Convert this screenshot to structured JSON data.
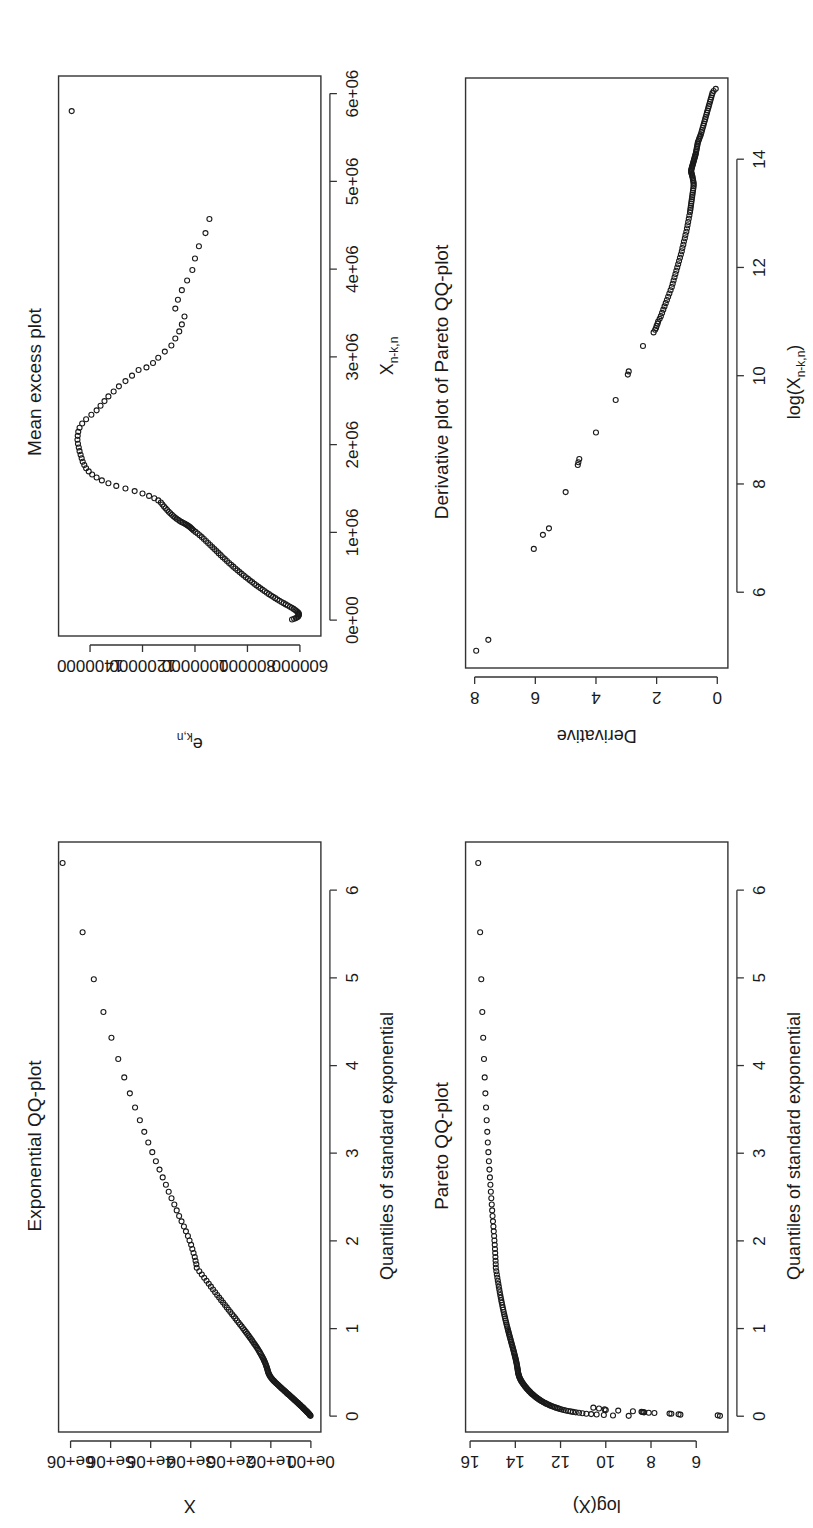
{
  "figure": {
    "layout": "2x2 grid of R base-graphics scatter plots, page rotated 90 degrees counter-clockwise",
    "background": "#ffffff",
    "point_color": "#1a1a1a",
    "frame_color": "#333333",
    "marker": "open-circle"
  },
  "chart_data": [
    {
      "id": "exponential-qq",
      "panel": "top-left (of the upright figure)",
      "type": "scatter",
      "title": "Exponential QQ-plot",
      "xlabel": "Quantiles of standard exponential",
      "ylabel": "X",
      "xlim": [
        -0.18,
        6.55
      ],
      "ylim": [
        -250000,
        6300000
      ],
      "xticks": [
        0,
        1,
        2,
        3,
        4,
        5,
        6
      ],
      "xticklabels": [
        "0",
        "1",
        "2",
        "3",
        "4",
        "5",
        "6"
      ],
      "yticks": [
        0,
        1000000,
        2000000,
        3000000,
        4000000,
        5000000,
        6000000
      ],
      "yticklabels": [
        "0e+00",
        "1e+06",
        "2e+06",
        "3e+06",
        "4e+06",
        "5e+06",
        "6e+06"
      ],
      "grid": false,
      "legend": "none",
      "x": [
        0.004,
        0.009,
        0.014,
        0.019,
        0.024,
        0.029,
        0.034,
        0.039,
        0.044,
        0.049,
        0.055,
        0.06,
        0.066,
        0.071,
        0.077,
        0.083,
        0.089,
        0.095,
        0.101,
        0.107,
        0.113,
        0.12,
        0.126,
        0.133,
        0.139,
        0.146,
        0.153,
        0.16,
        0.167,
        0.174,
        0.181,
        0.189,
        0.196,
        0.204,
        0.212,
        0.219,
        0.227,
        0.235,
        0.244,
        0.252,
        0.26,
        0.269,
        0.278,
        0.286,
        0.295,
        0.304,
        0.314,
        0.323,
        0.332,
        0.342,
        0.352,
        0.362,
        0.372,
        0.382,
        0.392,
        0.403,
        0.414,
        0.424,
        0.435,
        0.447,
        0.458,
        0.469,
        0.481,
        0.493,
        0.505,
        0.517,
        0.53,
        0.543,
        0.555,
        0.569,
        0.582,
        0.595,
        0.609,
        0.623,
        0.637,
        0.652,
        0.666,
        0.681,
        0.696,
        0.712,
        0.728,
        0.744,
        0.76,
        0.777,
        0.794,
        0.811,
        0.828,
        0.846,
        0.865,
        0.883,
        0.902,
        0.922,
        0.942,
        0.962,
        0.982,
        1.003,
        1.025,
        1.047,
        1.069,
        1.092,
        1.116,
        1.14,
        1.164,
        1.189,
        1.215,
        1.241,
        1.268,
        1.296,
        1.324,
        1.353,
        1.383,
        1.414,
        1.445,
        1.478,
        1.511,
        1.545,
        1.58,
        1.617,
        1.654,
        1.693,
        1.733,
        1.774,
        1.817,
        1.861,
        1.907,
        1.955,
        2.004,
        2.055,
        2.109,
        2.164,
        2.223,
        2.284,
        2.348,
        2.415,
        2.486,
        2.561,
        2.64,
        2.724,
        2.813,
        2.909,
        3.012,
        3.123,
        3.244,
        3.376,
        3.521,
        3.683,
        3.865,
        4.074,
        4.317,
        4.61,
        4.984,
        5.521,
        6.31
      ],
      "y": [
        8000,
        16000,
        24000,
        33000,
        42000,
        52000,
        62000,
        72000,
        83000,
        94000,
        105000,
        117000,
        129000,
        141000,
        154000,
        167000,
        180000,
        194000,
        208000,
        222000,
        236000,
        251000,
        266000,
        281000,
        297000,
        313000,
        329000,
        346000,
        363000,
        380000,
        398000,
        416000,
        434000,
        452000,
        471000,
        490000,
        509000,
        528000,
        548000,
        568000,
        589000,
        610000,
        631000,
        652000,
        674000,
        696000,
        718000,
        741000,
        764000,
        787000,
        810000,
        833000,
        857000,
        880000,
        903000,
        925000,
        947000,
        968000,
        988000,
        1006000,
        1022000,
        1036000,
        1048000,
        1059000,
        1068000,
        1076000,
        1084000,
        1092000,
        1101000,
        1110000,
        1120000,
        1131000,
        1143000,
        1156000,
        1170000,
        1185000,
        1201000,
        1218000,
        1236000,
        1255000,
        1275000,
        1296000,
        1318000,
        1341000,
        1365000,
        1390000,
        1416000,
        1443000,
        1471000,
        1500000,
        1530000,
        1561000,
        1593000,
        1626000,
        1660000,
        1695000,
        1731000,
        1768000,
        1806000,
        1845000,
        1885000,
        1926000,
        1968000,
        2011000,
        2055000,
        2100000,
        2146000,
        2193000,
        2241000,
        2290000,
        2340000,
        2391000,
        2443000,
        2496000,
        2550000,
        2606000,
        2664000,
        2724000,
        2786000,
        2850000,
        2860000,
        2880000,
        2900000,
        2930000,
        2960000,
        2990000,
        3030000,
        3070000,
        3120000,
        3170000,
        3230000,
        3290000,
        3350000,
        3410000,
        3480000,
        3550000,
        3620000,
        3700000,
        3780000,
        3870000,
        3960000,
        4060000,
        4160000,
        4270000,
        4390000,
        4520000,
        4660000,
        4810000,
        4980000,
        5180000,
        5420000,
        5700000,
        6200000
      ]
    },
    {
      "id": "mean-excess",
      "panel": "top-right (of the upright figure)",
      "type": "scatter",
      "title": "Mean excess plot",
      "xlabel": "X_{n-k,n}",
      "xlabel_base": "X",
      "xlabel_sub": "n-k,n",
      "ylabel": "e_{k,n}",
      "ylabel_base": "e",
      "ylabel_sub": "k,n",
      "xlim": [
        -180000,
        6200000
      ],
      "ylim": [
        520000,
        1520000
      ],
      "xticks": [
        0,
        1000000,
        2000000,
        3000000,
        4000000,
        5000000,
        6000000
      ],
      "xticklabels": [
        "0e+00",
        "1e+06",
        "2e+06",
        "3e+06",
        "4e+06",
        "5e+06",
        "6e+06"
      ],
      "yticks": [
        600000,
        800000,
        1000000,
        1200000,
        1400000
      ],
      "yticklabels": [
        "600000",
        "800000",
        "1000000",
        "1200000",
        "1400000"
      ],
      "grid": false,
      "legend": "none",
      "x": [
        8000,
        16000,
        24000,
        33000,
        42000,
        52000,
        62000,
        72000,
        83000,
        94000,
        105000,
        117000,
        129000,
        141000,
        154000,
        167000,
        180000,
        194000,
        208000,
        222000,
        236000,
        251000,
        266000,
        281000,
        297000,
        313000,
        329000,
        346000,
        363000,
        380000,
        398000,
        416000,
        434000,
        452000,
        471000,
        490000,
        509000,
        528000,
        548000,
        568000,
        589000,
        610000,
        631000,
        652000,
        674000,
        696000,
        718000,
        741000,
        764000,
        787000,
        810000,
        833000,
        857000,
        880000,
        903000,
        925000,
        947000,
        968000,
        988000,
        1006000,
        1022000,
        1036000,
        1048000,
        1059000,
        1068000,
        1076000,
        1084000,
        1092000,
        1101000,
        1110000,
        1120000,
        1131000,
        1143000,
        1156000,
        1170000,
        1185000,
        1201000,
        1218000,
        1236000,
        1255000,
        1275000,
        1296000,
        1318000,
        1341000,
        1365000,
        1390000,
        1416000,
        1443000,
        1471000,
        1500000,
        1530000,
        1561000,
        1593000,
        1626000,
        1660000,
        1695000,
        1731000,
        1768000,
        1806000,
        1845000,
        1885000,
        1926000,
        1968000,
        2011000,
        2055000,
        2100000,
        2146000,
        2193000,
        2241000,
        2290000,
        2340000,
        2391000,
        2443000,
        2496000,
        2550000,
        2606000,
        2664000,
        2724000,
        2786000,
        2850000,
        2880000,
        2930000,
        2990000,
        3060000,
        3130000,
        3210000,
        3290000,
        3370000,
        3460000,
        3550000,
        3650000,
        3760000,
        3870000,
        3990000,
        4120000,
        4260000,
        4410000,
        4570000,
        5800000
      ],
      "y": [
        630000,
        622000,
        615000,
        610000,
        607000,
        605000,
        604000,
        604000,
        606000,
        609000,
        613000,
        618000,
        624000,
        631000,
        638000,
        646000,
        654000,
        662000,
        670000,
        678000,
        686000,
        694000,
        702000,
        710000,
        718000,
        726000,
        734000,
        742000,
        750000,
        758000,
        766000,
        774000,
        782000,
        790000,
        798000,
        806000,
        814000,
        822000,
        830000,
        838000,
        846000,
        854000,
        862000,
        870000,
        878000,
        886000,
        894000,
        902000,
        910000,
        918000,
        926000,
        934000,
        942000,
        950000,
        958000,
        966000,
        974000,
        982000,
        990000,
        998000,
        1005000,
        1010000,
        1014000,
        1018000,
        1022000,
        1026000,
        1030000,
        1035000,
        1040000,
        1046000,
        1052000,
        1058000,
        1064000,
        1070000,
        1076000,
        1082000,
        1088000,
        1094000,
        1100000,
        1106000,
        1112000,
        1118000,
        1124000,
        1130000,
        1140000,
        1155000,
        1175000,
        1200000,
        1230000,
        1265000,
        1300000,
        1330000,
        1355000,
        1375000,
        1392000,
        1405000,
        1415000,
        1422000,
        1428000,
        1432000,
        1436000,
        1440000,
        1443000,
        1446000,
        1448000,
        1447000,
        1445000,
        1440000,
        1430000,
        1415000,
        1395000,
        1375000,
        1360000,
        1345000,
        1330000,
        1310000,
        1290000,
        1265000,
        1240000,
        1215000,
        1185000,
        1160000,
        1140000,
        1115000,
        1090000,
        1075000,
        1060000,
        1050000,
        1040000,
        1075000,
        1065000,
        1050000,
        1030000,
        1010000,
        1000000,
        985000,
        960000,
        945000,
        1470000
      ]
    },
    {
      "id": "pareto-qq",
      "panel": "bottom-left (of the upright figure)",
      "type": "scatter",
      "title": "Pareto QQ-plot",
      "xlabel": "Quantiles of standard exponential",
      "ylabel": "log(X)",
      "xlim": [
        -0.18,
        6.55
      ],
      "ylim": [
        4.6,
        16.2
      ],
      "xticks": [
        0,
        1,
        2,
        3,
        4,
        5,
        6
      ],
      "xticklabels": [
        "0",
        "1",
        "2",
        "3",
        "4",
        "5",
        "6"
      ],
      "yticks": [
        6,
        8,
        10,
        12,
        14,
        16
      ],
      "yticklabels": [
        "6",
        "8",
        "10",
        "12",
        "14",
        "16"
      ],
      "grid": false,
      "legend": "none",
      "note": "y is log of the Exponential QQ-plot ordinates; lowest observations spread from about 4.9 to 10.6 at x near 0",
      "x": [
        0.004,
        0.009,
        0.014,
        0.019,
        0.024,
        0.029,
        0.034,
        0.039,
        0.044,
        0.049,
        0.055,
        0.06,
        0.066,
        0.071,
        0.077,
        0.083,
        0.089,
        0.095,
        0.101,
        0.107,
        0.113,
        0.12,
        0.126,
        0.133,
        0.139,
        0.146,
        0.153,
        0.16,
        0.167,
        0.174,
        0.181,
        0.189,
        0.196,
        0.204,
        0.212,
        0.219,
        0.227,
        0.235,
        0.244,
        0.252,
        0.26,
        0.269,
        0.278,
        0.286,
        0.295,
        0.304,
        0.314,
        0.323,
        0.332,
        0.342,
        0.352,
        0.362,
        0.372,
        0.382,
        0.392,
        0.403,
        0.414,
        0.424,
        0.435,
        0.447,
        0.458,
        0.469,
        0.481,
        0.493,
        0.505,
        0.517,
        0.53,
        0.543,
        0.555,
        0.569,
        0.582,
        0.595,
        0.609,
        0.623,
        0.637,
        0.652,
        0.666,
        0.681,
        0.696,
        0.712,
        0.728,
        0.744,
        0.76,
        0.777,
        0.794,
        0.811,
        0.828,
        0.846,
        0.865,
        0.883,
        0.902,
        0.922,
        0.942,
        0.962,
        0.982,
        1.003,
        1.025,
        1.047,
        1.069,
        1.092,
        1.116,
        1.14,
        1.164,
        1.189,
        1.215,
        1.241,
        1.268,
        1.296,
        1.324,
        1.353,
        1.383,
        1.414,
        1.445,
        1.478,
        1.511,
        1.545,
        1.58,
        1.617,
        1.654,
        1.693,
        1.733,
        1.774,
        1.817,
        1.861,
        1.907,
        1.955,
        2.004,
        2.055,
        2.109,
        2.164,
        2.223,
        2.284,
        2.348,
        2.415,
        2.486,
        2.561,
        2.64,
        2.724,
        2.813,
        2.909,
        3.012,
        3.123,
        3.244,
        3.376,
        3.521,
        3.683,
        3.865,
        4.074,
        4.317,
        4.61,
        4.984,
        5.521,
        6.31
      ],
      "y_from": "log(exponential-qq.y)"
    },
    {
      "id": "derivative-pareto-qq",
      "panel": "bottom-right (of the upright figure)",
      "type": "scatter",
      "title": "Derivative plot of Pareto QQ-plot",
      "xlabel": "log(X_{n-k,n})",
      "xlabel_base": "log(X",
      "xlabel_sub": "n-k,n",
      "xlabel_tail": ")",
      "ylabel": "Derivative",
      "xlim": [
        4.6,
        15.5
      ],
      "ylim": [
        -0.35,
        8.3
      ],
      "xticks": [
        6,
        8,
        10,
        12,
        14
      ],
      "xticklabels": [
        "6",
        "8",
        "10",
        "12",
        "14"
      ],
      "yticks": [
        0,
        2,
        4,
        6,
        8
      ],
      "yticklabels": [
        "0",
        "2",
        "4",
        "6",
        "8"
      ],
      "grid": false,
      "legend": "none",
      "x": [
        4.92,
        5.12,
        6.8,
        7.06,
        7.18,
        7.85,
        8.35,
        8.4,
        8.46,
        8.95,
        9.55,
        10.02,
        10.08,
        10.55,
        10.8,
        10.85,
        10.88,
        10.92,
        10.96,
        11.0,
        11.05,
        11.1,
        11.16,
        11.22,
        11.28,
        11.34,
        11.4,
        11.46,
        11.52,
        11.58,
        11.64,
        11.7,
        11.76,
        11.82,
        11.88,
        11.94,
        12.0,
        12.06,
        12.12,
        12.18,
        12.24,
        12.3,
        12.36,
        12.42,
        12.48,
        12.54,
        12.6,
        12.66,
        12.72,
        12.78,
        12.84,
        12.9,
        12.96,
        13.02,
        13.06,
        13.1,
        13.14,
        13.18,
        13.22,
        13.26,
        13.3,
        13.34,
        13.38,
        13.42,
        13.46,
        13.5,
        13.53,
        13.56,
        13.59,
        13.62,
        13.65,
        13.68,
        13.7,
        13.72,
        13.74,
        13.76,
        13.78,
        13.8,
        13.82,
        13.84,
        13.86,
        13.88,
        13.9,
        13.92,
        13.94,
        13.96,
        13.98,
        14.0,
        14.02,
        14.04,
        14.06,
        14.08,
        14.1,
        14.13,
        14.16,
        14.19,
        14.22,
        14.25,
        14.28,
        14.31,
        14.34,
        14.37,
        14.4,
        14.43,
        14.46,
        14.5,
        14.54,
        14.58,
        14.62,
        14.66,
        14.7,
        14.74,
        14.78,
        14.82,
        14.86,
        14.9,
        14.94,
        14.98,
        15.02,
        15.06,
        15.1,
        15.14,
        15.18,
        15.22,
        15.26,
        15.3
      ],
      "y": [
        7.95,
        7.55,
        6.05,
        5.75,
        5.55,
        5.0,
        4.6,
        4.58,
        4.55,
        4.0,
        3.35,
        2.95,
        2.92,
        2.45,
        2.1,
        2.05,
        2.02,
        2.0,
        1.97,
        1.95,
        1.9,
        1.86,
        1.82,
        1.78,
        1.74,
        1.7,
        1.66,
        1.62,
        1.58,
        1.54,
        1.5,
        1.47,
        1.44,
        1.41,
        1.38,
        1.35,
        1.32,
        1.29,
        1.26,
        1.23,
        1.2,
        1.17,
        1.15,
        1.12,
        1.1,
        1.07,
        1.05,
        1.02,
        1.0,
        0.98,
        0.96,
        0.94,
        0.92,
        0.9,
        0.89,
        0.88,
        0.87,
        0.86,
        0.85,
        0.84,
        0.83,
        0.82,
        0.81,
        0.8,
        0.79,
        0.78,
        0.78,
        0.78,
        0.79,
        0.8,
        0.81,
        0.82,
        0.83,
        0.84,
        0.85,
        0.86,
        0.86,
        0.86,
        0.85,
        0.84,
        0.83,
        0.82,
        0.81,
        0.8,
        0.79,
        0.78,
        0.77,
        0.76,
        0.75,
        0.74,
        0.73,
        0.72,
        0.71,
        0.7,
        0.69,
        0.68,
        0.67,
        0.66,
        0.65,
        0.64,
        0.62,
        0.6,
        0.58,
        0.56,
        0.54,
        0.52,
        0.5,
        0.48,
        0.46,
        0.44,
        0.42,
        0.4,
        0.38,
        0.36,
        0.34,
        0.32,
        0.3,
        0.28,
        0.26,
        0.24,
        0.22,
        0.2,
        0.18,
        0.16,
        0.12,
        0.05
      ]
    }
  ]
}
